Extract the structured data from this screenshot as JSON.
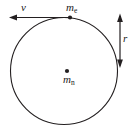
{
  "figure": {
    "background_color": "#ffffff",
    "stroke_color": "#231f20",
    "canvas": {
      "width": 135,
      "height": 134
    }
  },
  "labels": {
    "velocity": {
      "symbol": "v",
      "subscript": ""
    },
    "orbiting_mass": {
      "symbol": "m",
      "subscript": "e"
    },
    "central_mass": {
      "symbol": "m",
      "subscript": "n"
    },
    "radius": {
      "symbol": "r",
      "subscript": ""
    }
  },
  "chart_data": {
    "type": "diagram",
    "elements": [
      {
        "name": "orbit-circle",
        "kind": "circle",
        "cx": 64,
        "cy": 71,
        "r": 53.5,
        "stroke": "#231f20",
        "stroke_width": 1.1,
        "fill": "none"
      },
      {
        "name": "central-mass-point",
        "kind": "point",
        "x": 67,
        "y": 71,
        "r": 2.1,
        "label": "m_n"
      },
      {
        "name": "orbiting-mass-point",
        "kind": "point",
        "x": 70,
        "y": 17.5,
        "r": 2.1,
        "label": "m_e"
      },
      {
        "name": "velocity-vector",
        "kind": "arrow",
        "x1": 70,
        "y1": 17.5,
        "x2": 9,
        "y2": 17.5,
        "heads": "end",
        "direction": "left",
        "label": "v"
      },
      {
        "name": "radius-measure",
        "kind": "arrow",
        "x1": 120,
        "y1": 13.5,
        "x2": 120,
        "y2": 68,
        "heads": "both",
        "direction": "vertical",
        "label": "r"
      }
    ],
    "annotations": [
      {
        "text": "v",
        "x": 24,
        "y": 8
      },
      {
        "text": "m_e",
        "x": 72,
        "y": 8
      },
      {
        "text": "m_n",
        "x": 68,
        "y": 80
      },
      {
        "text": "r",
        "x": 125,
        "y": 39
      }
    ]
  }
}
